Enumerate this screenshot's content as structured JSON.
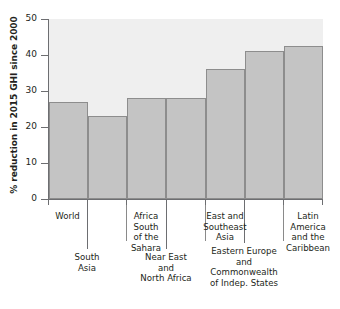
{
  "chart_data": {
    "type": "bar",
    "title": "",
    "subtitle": "",
    "xlabel": "",
    "ylabel": "% reduction in 2015 GHI since 2000",
    "ylim": [
      0,
      50
    ],
    "yticks": [
      0,
      10,
      20,
      30,
      40,
      50
    ],
    "ytick_labels": [
      "0",
      "10",
      "20",
      "30",
      "40",
      "50"
    ],
    "grid": false,
    "legend": null,
    "categories": [
      "World",
      "South Asia",
      "Africa South of the Sahara",
      "Near East and North Africa",
      "East and Southeast Asia",
      "Eastern Europe and Commonwealth of Indep. States",
      "Latin America and the Caribbean"
    ],
    "values": [
      27,
      23,
      28,
      28,
      36,
      41,
      42.5
    ],
    "bar_color": "#c4c4c4",
    "bar_edge_color": "#8d8d8d",
    "plot_background": "#efefef",
    "axis_color": "#6d6e71",
    "text_color": "#231f20"
  },
  "axis": {
    "y_title": "% reduction in 2015 GHI since 2000",
    "tick_50": "50",
    "tick_40": "40",
    "tick_30": "30",
    "tick_20": "20",
    "tick_10": "10",
    "tick_0": "0"
  },
  "categories": {
    "c0_line1": "World",
    "c1_line1": "South",
    "c1_line2": "Asia",
    "c2_line1": "Africa South",
    "c2_line2": "of the Sahara",
    "c3_line1": "Near East and",
    "c3_line2": "North Africa",
    "c4_line1": "East and",
    "c4_line2": "Southeast Asia",
    "c5_line1": "Eastern Europe",
    "c5_line2": "and",
    "c5_line3": "Commonwealth",
    "c5_line4": "of Indep. States",
    "c6_line1": "Latin America",
    "c6_line2": "and the",
    "c6_line3": "Caribbean"
  }
}
